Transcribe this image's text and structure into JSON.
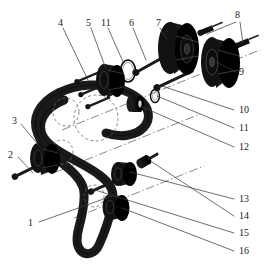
{
  "figure": {
    "type": "exploded-parts-diagram",
    "background_color": "#ffffff",
    "ink_color": "#111111",
    "line_color": "#4a4a4a",
    "width": 264,
    "height": 272
  },
  "callouts": [
    {
      "id": "1",
      "label": "1",
      "x": 30,
      "y": 224,
      "part": "timing-belt",
      "leader": [
        [
          38,
          222
        ],
        [
          110,
          196
        ]
      ]
    },
    {
      "id": "2",
      "label": "2",
      "x": 8,
      "y": 152,
      "part": "tensioner-bolt",
      "leader": [
        [
          17,
          156
        ],
        [
          33,
          172
        ]
      ]
    },
    {
      "id": "3",
      "label": "3",
      "x": 10,
      "y": 118,
      "part": "belt-tensioner-pulley",
      "leader": [
        [
          19,
          123
        ],
        [
          42,
          147
        ]
      ]
    },
    {
      "id": "4",
      "label": "4",
      "x": 58,
      "y": 20,
      "part": "water-pump-bolt",
      "leader": [
        [
          63,
          26
        ],
        [
          86,
          77
        ]
      ]
    },
    {
      "id": "5",
      "label": "5",
      "x": 86,
      "y": 20,
      "part": "water-pump-sprocket",
      "leader": [
        [
          90,
          26
        ],
        [
          107,
          68
        ]
      ]
    },
    {
      "id": "11",
      "label": "11",
      "x": 101,
      "y": 20,
      "part": "washer-ring-upper",
      "leader": [
        [
          107,
          26
        ],
        [
          122,
          66
        ]
      ]
    },
    {
      "id": "6",
      "label": "6",
      "x": 129,
      "y": 20,
      "part": "long-through-bolt",
      "leader": [
        [
          133,
          26
        ],
        [
          147,
          58
        ]
      ]
    },
    {
      "id": "7",
      "label": "7",
      "x": 156,
      "y": 20,
      "part": "camshaft-sprocket-left",
      "leader": [
        [
          160,
          26
        ],
        [
          168,
          38
        ]
      ]
    },
    {
      "id": "8",
      "label": "8",
      "x": 235,
      "y": 13,
      "part": "camshaft-sprocket-bolts",
      "leader": [
        [
          236,
          20
        ],
        [
          206,
          33
        ]
      ],
      "leader2": [
        [
          240,
          20
        ],
        [
          242,
          42
        ]
      ]
    },
    {
      "id": "9",
      "label": "9",
      "x": 238,
      "y": 75,
      "part": "camshaft-sprocket-right",
      "leader": [
        [
          236,
          71
        ],
        [
          216,
          60
        ]
      ]
    },
    {
      "id": "10",
      "label": "10",
      "x": 238,
      "y": 113,
      "part": "hub-bolt",
      "leader": [
        [
          236,
          110
        ],
        [
          160,
          84
        ]
      ]
    },
    {
      "id": "12",
      "label": "12",
      "x": 238,
      "y": 150,
      "part": "spacer-bushing",
      "leader": [
        [
          236,
          147
        ],
        [
          135,
          105
        ]
      ]
    },
    {
      "id": "13",
      "label": "13",
      "x": 238,
      "y": 202,
      "part": "idler-pulley-upper",
      "leader": [
        [
          236,
          199
        ],
        [
          128,
          170
        ]
      ]
    },
    {
      "id": "14",
      "label": "14",
      "x": 238,
      "y": 219,
      "part": "idler-bolt",
      "leader": [
        [
          236,
          216
        ],
        [
          147,
          164
        ]
      ]
    },
    {
      "id": "15",
      "label": "15",
      "x": 238,
      "y": 236,
      "part": "crank-bolt",
      "leader": [
        [
          236,
          233
        ],
        [
          92,
          188
        ]
      ]
    },
    {
      "id": "16",
      "label": "16",
      "x": 238,
      "y": 254,
      "part": "crankshaft-sprocket",
      "leader": [
        [
          236,
          251
        ],
        [
          120,
          204
        ]
      ]
    }
  ],
  "callouts_secondary": [
    {
      "id": "11b",
      "label": "11",
      "x": 238,
      "y": 131,
      "part": "washer-ring-lower",
      "leader": [
        [
          236,
          128
        ],
        [
          152,
          94
        ]
      ]
    }
  ],
  "parts": {
    "belt": {
      "name": "timing-belt",
      "outer_path": "M 62,104 C 46,112 40,126 48,136 C 56,147 86,158 104,170 C 116,178 120,186 118,200 C 116,214 112,228 108,240 C 104,251 96,254 90,250 C 84,246 82,238 84,228 C 87,213 90,198 88,188 C 86,177 74,168 62,158 C 46,145 36,130 40,116 C 44,100 64,90 84,88 C 104,86 122,90 134,98 C 146,106 150,116 144,124 C 138,132 124,134 112,130",
      "width": 9
    },
    "dashed_circles": [
      {
        "cx": 96,
        "cy": 116,
        "r": 22,
        "label": "camshaft-pulley-seat"
      },
      {
        "cx": 66,
        "cy": 112,
        "r": 13,
        "label": "water-pump-seat"
      },
      {
        "cx": 61,
        "cy": 150,
        "r": 11,
        "label": "tensioner-seat"
      },
      {
        "cx": 92,
        "cy": 195,
        "r": 10,
        "label": "crank-seat"
      }
    ],
    "sprockets": [
      {
        "id": "cam-sprocket-left",
        "cx": 178,
        "cy": 48,
        "rx": 23,
        "ry": 26,
        "depth": 16,
        "name": "camshaft-sprocket-left"
      },
      {
        "id": "cam-sprocket-right",
        "cx": 221,
        "cy": 62,
        "rx": 22,
        "ry": 25,
        "depth": 15,
        "name": "camshaft-sprocket-right"
      },
      {
        "id": "pump-sprocket",
        "cx": 112,
        "cy": 80,
        "rx": 13,
        "ry": 16,
        "depth": 11,
        "name": "water-pump-sprocket"
      },
      {
        "id": "tensioner-pulley",
        "cx": 45,
        "cy": 157,
        "rx": 13,
        "ry": 15,
        "depth": 10,
        "name": "belt-tensioner-pulley"
      },
      {
        "id": "idler-pulley-upper",
        "cx": 124,
        "cy": 173,
        "rx": 11,
        "ry": 12,
        "depth": 9,
        "name": "idler-pulley-upper"
      },
      {
        "id": "crank-sprocket",
        "cx": 116,
        "cy": 207,
        "rx": 12,
        "ry": 13,
        "depth": 9,
        "name": "crankshaft-sprocket"
      }
    ],
    "bolts": [
      {
        "id": "bolt-cam-1",
        "x1": 201,
        "y1": 32,
        "x2": 222,
        "y2": 23,
        "name": "camshaft-bolt-1"
      },
      {
        "id": "bolt-cam-2",
        "x1": 238,
        "y1": 45,
        "x2": 258,
        "y2": 36,
        "name": "camshaft-bolt-2"
      },
      {
        "id": "bolt-long",
        "x1": 136,
        "y1": 73,
        "x2": 166,
        "y2": 56,
        "name": "long-through-bolt"
      },
      {
        "id": "bolt-hub",
        "x1": 158,
        "y1": 86,
        "x2": 192,
        "y2": 70,
        "name": "hub-bolt"
      },
      {
        "id": "bolt-pump-1",
        "x1": 84,
        "y1": 81,
        "x2": 104,
        "y2": 73,
        "name": "water-pump-bolt-1"
      },
      {
        "id": "bolt-pump-2",
        "x1": 88,
        "y1": 93,
        "x2": 108,
        "y2": 85,
        "name": "water-pump-bolt-2"
      },
      {
        "id": "bolt-pump-3",
        "x1": 94,
        "y1": 105,
        "x2": 114,
        "y2": 97,
        "name": "water-pump-bolt-3"
      },
      {
        "id": "bolt-tens",
        "x1": 14,
        "y1": 177,
        "x2": 42,
        "y2": 164,
        "name": "tensioner-bolt"
      },
      {
        "id": "bolt-idler",
        "x1": 141,
        "y1": 164,
        "x2": 156,
        "y2": 157,
        "name": "idler-bolt"
      },
      {
        "id": "bolt-crank",
        "x1": 91,
        "y1": 192,
        "x2": 116,
        "y2": 181,
        "name": "crank-bolt"
      }
    ],
    "small_parts": [
      {
        "id": "spacer-bushing",
        "cx": 135,
        "cy": 104,
        "rx": 7,
        "ry": 8,
        "name": "spacer-bushing"
      },
      {
        "id": "washer-upper",
        "cx": 128,
        "cy": 70,
        "rx": 8,
        "ry": 11,
        "name": "washer-ring-upper"
      },
      {
        "id": "washer-lower",
        "cx": 155,
        "cy": 96,
        "rx": 5,
        "ry": 7,
        "name": "washer-ring-lower"
      }
    ],
    "center_lines": [
      {
        "x1": 68,
        "y1": 128,
        "x2": 258,
        "y2": 52,
        "name": "camshaft-axis"
      },
      {
        "x1": 60,
        "y1": 170,
        "x2": 196,
        "y2": 116,
        "name": "pump-axis"
      },
      {
        "x1": 80,
        "y1": 214,
        "x2": 200,
        "y2": 168,
        "name": "crank-axis"
      }
    ]
  }
}
